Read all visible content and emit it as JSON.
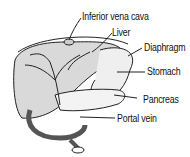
{
  "diagram": {
    "labels": {
      "ivc": "Inferior vena cava",
      "liver": "Liver",
      "diaphragm": "Diaphragm",
      "stomach": "Stomach",
      "pancreas": "Pancreas",
      "portal_vein": "Portal vein"
    }
  }
}
